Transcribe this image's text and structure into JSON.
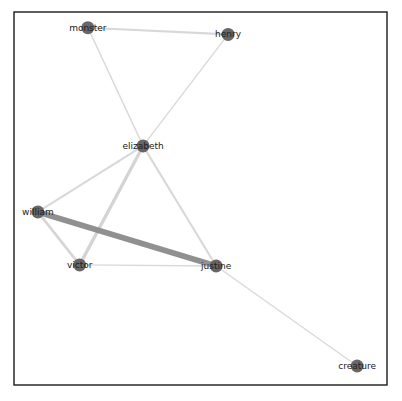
{
  "graph": {
    "type": "network",
    "title": "",
    "node_color": "#5f5f5f",
    "edge_color_light": "#cccccc",
    "edge_color_dark": "#8a8a8a",
    "nodes": [
      {
        "id": "monster",
        "label": "monster",
        "x": 0.198,
        "y": 0.958
      },
      {
        "id": "henry",
        "label": "henry",
        "x": 0.574,
        "y": 0.94
      },
      {
        "id": "elizabeth",
        "label": "elizabeth",
        "x": 0.346,
        "y": 0.641
      },
      {
        "id": "william",
        "label": "william",
        "x": 0.064,
        "y": 0.464
      },
      {
        "id": "victor",
        "label": "victor",
        "x": 0.176,
        "y": 0.322
      },
      {
        "id": "justine",
        "label": "justine",
        "x": 0.542,
        "y": 0.319
      },
      {
        "id": "creature",
        "label": "creature",
        "x": 0.92,
        "y": 0.051
      }
    ],
    "edges": [
      {
        "source": "monster",
        "target": "henry",
        "weight": 2
      },
      {
        "source": "monster",
        "target": "elizabeth",
        "weight": 1
      },
      {
        "source": "henry",
        "target": "elizabeth",
        "weight": 1
      },
      {
        "source": "elizabeth",
        "target": "william",
        "weight": 2
      },
      {
        "source": "elizabeth",
        "target": "victor",
        "weight": 4
      },
      {
        "source": "elizabeth",
        "target": "justine",
        "weight": 2
      },
      {
        "source": "william",
        "target": "justine",
        "weight": 8
      },
      {
        "source": "william",
        "target": "victor",
        "weight": 3
      },
      {
        "source": "victor",
        "target": "justine",
        "weight": 1
      },
      {
        "source": "justine",
        "target": "creature",
        "weight": 1
      }
    ]
  }
}
